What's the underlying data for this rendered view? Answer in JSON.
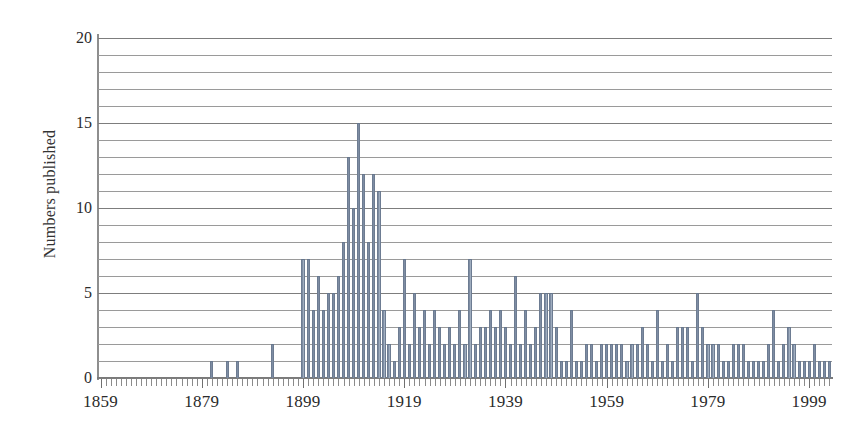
{
  "chart_data": {
    "type": "bar",
    "title": "",
    "subtitle": "",
    "xlabel": "",
    "ylabel": "Numbers published",
    "xlim": [
      1859,
      2003
    ],
    "ylim": [
      0,
      20
    ],
    "grid": true,
    "grid_step": 1,
    "legend": "none",
    "y_tick_labels": [
      "0",
      "5",
      "10",
      "15",
      "20"
    ],
    "y_tick_values": [
      0,
      5,
      10,
      15,
      20
    ],
    "x_tick_labels": [
      "1859",
      "1879",
      "1899",
      "1919",
      "1939",
      "1959",
      "1979",
      "1999"
    ],
    "x_tick_values": [
      1859,
      1879,
      1899,
      1919,
      1939,
      1959,
      1979,
      1999
    ],
    "x_minor_tick_step": 1,
    "bar_color": "#7e8da3",
    "bar_edge_color": "#6d7c92",
    "grid_color": "#7d7d7d",
    "axis_color": "#8e8e8e",
    "categories": [
      1859,
      1860,
      1861,
      1862,
      1863,
      1864,
      1865,
      1866,
      1867,
      1868,
      1869,
      1870,
      1871,
      1872,
      1873,
      1874,
      1875,
      1876,
      1877,
      1878,
      1879,
      1880,
      1881,
      1882,
      1883,
      1884,
      1885,
      1886,
      1887,
      1888,
      1889,
      1890,
      1891,
      1892,
      1893,
      1894,
      1895,
      1896,
      1897,
      1898,
      1899,
      1900,
      1901,
      1902,
      1903,
      1904,
      1905,
      1906,
      1907,
      1908,
      1909,
      1910,
      1911,
      1912,
      1913,
      1914,
      1915,
      1916,
      1917,
      1918,
      1919,
      1920,
      1921,
      1922,
      1923,
      1924,
      1925,
      1926,
      1927,
      1928,
      1929,
      1930,
      1931,
      1932,
      1933,
      1934,
      1935,
      1936,
      1937,
      1938,
      1939,
      1940,
      1941,
      1942,
      1943,
      1944,
      1945,
      1946,
      1947,
      1948,
      1949,
      1950,
      1951,
      1952,
      1953,
      1954,
      1955,
      1956,
      1957,
      1958,
      1959,
      1960,
      1961,
      1962,
      1963,
      1964,
      1965,
      1966,
      1967,
      1968,
      1969,
      1970,
      1971,
      1972,
      1973,
      1974,
      1975,
      1976,
      1977,
      1978,
      1979,
      1980,
      1981,
      1982,
      1983,
      1984,
      1985,
      1986,
      1987,
      1988,
      1989,
      1990,
      1991,
      1992,
      1993,
      1994,
      1995,
      1996,
      1997,
      1998,
      1999,
      2000,
      2001,
      2002,
      2003
    ],
    "values": [
      0,
      0,
      0,
      0,
      0,
      0,
      0,
      0,
      0,
      0,
      0,
      0,
      0,
      0,
      0,
      0,
      0,
      0,
      0,
      0,
      0,
      0,
      1,
      0,
      0,
      1,
      0,
      1,
      0,
      0,
      0,
      0,
      0,
      0,
      2,
      0,
      0,
      0,
      0,
      0,
      7,
      7,
      4,
      6,
      4,
      5,
      5,
      6,
      8,
      13,
      10,
      15,
      12,
      8,
      12,
      11,
      4,
      2,
      1,
      3,
      7,
      2,
      5,
      3,
      4,
      2,
      4,
      3,
      2,
      3,
      2,
      4,
      2,
      7,
      2,
      3,
      3,
      4,
      3,
      4,
      3,
      2,
      6,
      2,
      4,
      2,
      3,
      5,
      5,
      5,
      3,
      1,
      1,
      4,
      1,
      1,
      2,
      2,
      1,
      2,
      2,
      2,
      2,
      2,
      1,
      2,
      2,
      3,
      2,
      1,
      4,
      1,
      2,
      1,
      3,
      3,
      3,
      1,
      5,
      3,
      2,
      2,
      2,
      1,
      1,
      2,
      2,
      2,
      1,
      1,
      1,
      1,
      2,
      4,
      1,
      2,
      3,
      2,
      1,
      1,
      1,
      2,
      1,
      1,
      1
    ]
  }
}
